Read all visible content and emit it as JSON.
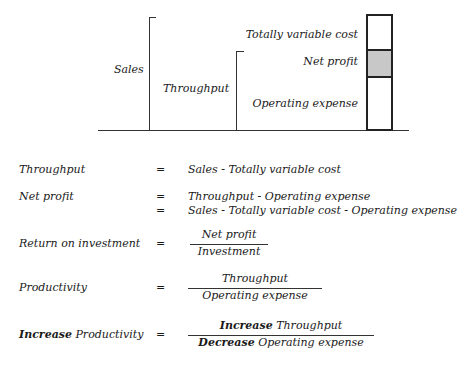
{
  "diagram": {
    "left_labels": {
      "sales": "Sales",
      "throughput": "Throughput"
    },
    "bar_labels": {
      "tvc": "Totally variable cost",
      "net_profit": "Net profit",
      "opex": "Operating expense"
    },
    "colors": {
      "net_profit_fill": "#c8c8c8",
      "line": "#333333"
    }
  },
  "formulas": [
    {
      "label": "Throughput",
      "eq": "=",
      "rhs": "Sales - Totally variable cost"
    },
    {
      "label": "Net profit",
      "eq": "=",
      "rhs": "Throughput - Operating expense",
      "eq2": "=",
      "rhs2": "Sales - Totally variable cost - Operating expense"
    },
    {
      "label": "Return on investment",
      "eq": "=",
      "numerator": "Net profit",
      "denominator": "Investment"
    },
    {
      "label": "Productivity",
      "eq": "=",
      "numerator": "Throughput",
      "denominator": "Operating expense"
    },
    {
      "label_bold": "Increase",
      "label": "Productivity",
      "eq": "=",
      "num_bold": "Increase",
      "numerator": "Throughput",
      "den_bold": "Decrease",
      "denominator": "Operating expense"
    }
  ]
}
